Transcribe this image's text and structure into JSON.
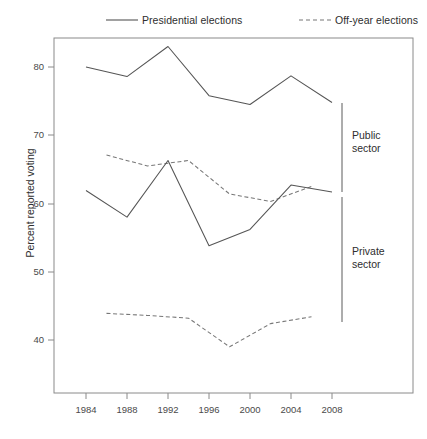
{
  "legend": {
    "entries": [
      {
        "label": "Presidential elections",
        "style": "solid",
        "color": "#555555"
      },
      {
        "label": "Off-year elections",
        "style": "dashed",
        "color": "#777777"
      }
    ]
  },
  "annotations": {
    "public_sector": "Public\nsector",
    "public_sector_line1": "Public",
    "public_sector_line2": "sector",
    "private_sector_line1": "Private",
    "private_sector_line2": "sector"
  },
  "chart_data": {
    "type": "line",
    "title": "",
    "xlabel": "",
    "ylabel": "Percent reported voting",
    "xlim": [
      1982,
      2010
    ],
    "ylim": [
      34,
      85
    ],
    "yticks": [
      40,
      50,
      60,
      70,
      80
    ],
    "xticks": [
      1984,
      1988,
      1992,
      1996,
      2000,
      2004,
      2008
    ],
    "grid": false,
    "legend_position": "above-plot",
    "series": [
      {
        "name": "Public sector - Presidential elections",
        "group": "Public sector",
        "style": "solid",
        "color": "#555555",
        "x": [
          1984,
          1988,
          1992,
          1996,
          2000,
          2004,
          2008
        ],
        "values": [
          80.0,
          78.6,
          83.0,
          75.8,
          74.5,
          78.7,
          74.8
        ]
      },
      {
        "name": "Public sector - Off-year elections",
        "group": "Public sector",
        "style": "dashed",
        "color": "#777777",
        "x": [
          1986,
          1990,
          1994,
          1998,
          2002,
          2006
        ],
        "values": [
          67.1,
          65.5,
          66.3,
          61.4,
          60.3,
          62.5
        ]
      },
      {
        "name": "Private sector - Presidential elections",
        "group": "Private sector",
        "style": "solid",
        "color": "#555555",
        "x": [
          1984,
          1988,
          1992,
          1996,
          2000,
          2004,
          2008
        ],
        "values": [
          61.9,
          58.0,
          66.3,
          53.8,
          56.2,
          62.7,
          61.7
        ]
      },
      {
        "name": "Private sector - Off-year elections",
        "group": "Private sector",
        "style": "dashed",
        "color": "#777777",
        "x": [
          1986,
          1990,
          1994,
          1998,
          2002,
          2006
        ],
        "values": [
          43.9,
          43.6,
          43.2,
          39.0,
          42.4,
          43.4
        ]
      }
    ]
  }
}
